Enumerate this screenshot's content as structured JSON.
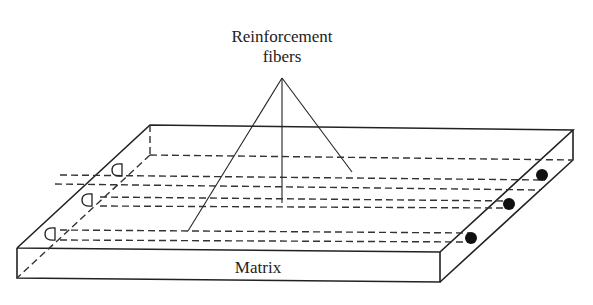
{
  "diagram": {
    "labels": {
      "fibers_line1": "Reinforcement",
      "fibers_line2": "fibers",
      "matrix": "Matrix"
    },
    "fiber_count": 3,
    "colors": {
      "stroke": "#222222",
      "fiber_end": "#111111",
      "background": "#ffffff"
    }
  }
}
